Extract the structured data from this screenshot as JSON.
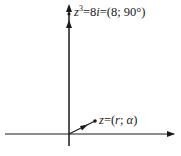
{
  "diagram": {
    "type": "complex-plane",
    "axes": {
      "horizontal": {
        "label": ""
      },
      "vertical": {
        "label": ""
      }
    },
    "vectors": [
      {
        "name": "z-cubed",
        "label_var": "z",
        "label_exp": "3",
        "label_eq": "=8",
        "label_i": "i",
        "label_rest": "=(8; 90°)",
        "direction_deg": 90
      },
      {
        "name": "z",
        "label_var": "z",
        "label_eq": "=(",
        "label_r": "r",
        "label_sep": "; ",
        "label_alpha": "α",
        "label_close": ")",
        "direction_deg": 30
      }
    ]
  },
  "colors": {
    "stroke": "#1a1a1a",
    "background": "#ffffff"
  }
}
